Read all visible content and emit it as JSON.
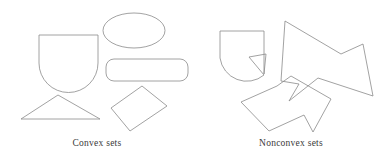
{
  "figure": {
    "width": 388,
    "height": 164,
    "background_color": "#ffffff",
    "stroke_color": "#8a8a8a",
    "text_color": "#3a3a3a"
  },
  "panels": {
    "left": {
      "caption": "Convex sets",
      "shapes": [
        {
          "name": "shield-shape",
          "kind": "path",
          "d": "M 39 35 L 39 63 A 29.5 29.5 0 0 0 98 63 L 98 35 Z"
        },
        {
          "name": "ellipse-shape",
          "kind": "ellipse",
          "cx": 134,
          "cy": 30.5,
          "rx": 31,
          "ry": 17.5
        },
        {
          "name": "rounded-rectangle-shape",
          "kind": "rect",
          "x": 106,
          "y": 59,
          "width": 82,
          "height": 22,
          "rx": 8,
          "ry": 8
        },
        {
          "name": "triangle-shape",
          "kind": "polygon",
          "points": "58,95 100,119 21,119"
        },
        {
          "name": "tilted-rectangle-shape",
          "kind": "polygon",
          "points": "142,86 167,106 130,131 111,108"
        }
      ]
    },
    "right": {
      "caption": "Nonconvex sets",
      "shapes": [
        {
          "name": "notched-shield-shape",
          "kind": "path",
          "d": "M 220 31 L 220 58 A 27 27 0 0 0 264 75 L 249 57 L 266 54 L 264 74 L 264 31 Z"
        },
        {
          "name": "star-polygon-shape",
          "kind": "polygon",
          "points": "285,21 341,54 363,44 373,96 318,78 289,101 299,84 281,81"
        },
        {
          "name": "block-arrow-shape",
          "kind": "polygon",
          "points": "291,76 331,99 313,132 304,115 269,131 241,102 277,86"
        }
      ]
    }
  }
}
